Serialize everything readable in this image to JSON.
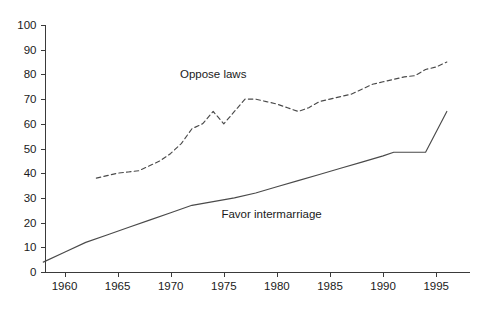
{
  "chart_data": {
    "type": "line",
    "title": "",
    "subtitle": "",
    "xlabel": "",
    "ylabel": "",
    "xlim": [
      1958,
      1997
    ],
    "ylim": [
      0,
      100
    ],
    "grid": false,
    "legend_position": "inline-annotation",
    "x_ticks": [
      1960,
      1965,
      1970,
      1975,
      1980,
      1985,
      1990,
      1995
    ],
    "x_tick_labels": [
      "1960",
      "1965",
      "1970",
      "1975",
      "1980",
      "1985",
      "1990",
      "1995"
    ],
    "y_ticks": [
      0,
      10,
      20,
      30,
      40,
      50,
      60,
      70,
      80,
      90,
      100
    ],
    "y_tick_labels": [
      "0",
      "10",
      "20",
      "30",
      "40",
      "50",
      "60",
      "70",
      "80",
      "90",
      "100"
    ],
    "series": [
      {
        "name": "Oppose laws",
        "style": "dashed",
        "label_text": "Oppose laws",
        "label_x": 1974.0,
        "label_y": 78.5,
        "x": [
          1963,
          1964,
          1965,
          1966,
          1967,
          1968,
          1969,
          1970,
          1971,
          1972,
          1973,
          1974,
          1975,
          1976,
          1977,
          1978,
          1979,
          1980,
          1981,
          1982,
          1983,
          1984,
          1985,
          1986,
          1987,
          1988,
          1989,
          1990,
          1991,
          1992,
          1993,
          1994,
          1995,
          1996
        ],
        "y": [
          38,
          39,
          40,
          40.5,
          41,
          43,
          45,
          48,
          52,
          58,
          60,
          65,
          60,
          65,
          70,
          70,
          69,
          68,
          66.5,
          65,
          66.5,
          69,
          70,
          71,
          72,
          74,
          76,
          77,
          78,
          79,
          79.5,
          82,
          83,
          85
        ]
      },
      {
        "name": "Favor intermarriage",
        "style": "solid",
        "label_text": "Favor intermarriage",
        "label_x": 1979.5,
        "label_y": 22.0,
        "x": [
          1958,
          1960,
          1962,
          1964,
          1966,
          1968,
          1970,
          1972,
          1974,
          1976,
          1978,
          1980,
          1982,
          1984,
          1986,
          1988,
          1990,
          1991,
          1994,
          1996
        ],
        "y": [
          4,
          8,
          12,
          15,
          18,
          21,
          24,
          27,
          28.5,
          30,
          32,
          34.5,
          37,
          39.5,
          42,
          44.5,
          47,
          48.5,
          48.5,
          65
        ]
      }
    ]
  },
  "axes": {
    "y_axis_name": "percent-axis",
    "x_axis_name": "year-axis"
  }
}
